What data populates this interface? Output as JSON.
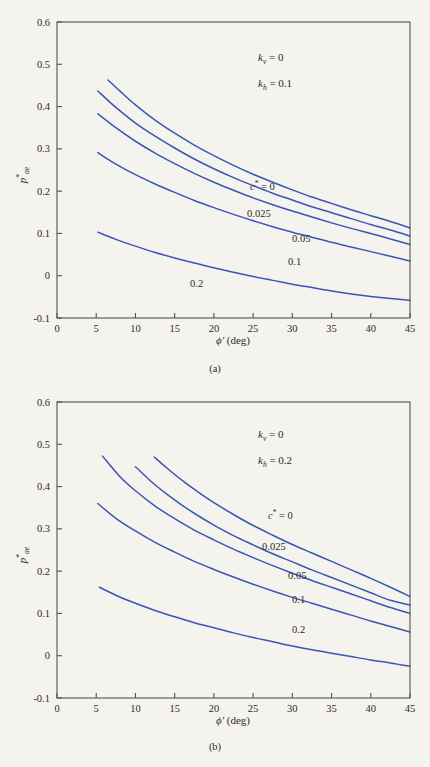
{
  "figure": {
    "background_color": "#f5f3ee",
    "curve_color": "#3a56b4",
    "axis_color": "#55524c"
  },
  "chart_data": [
    {
      "type": "line",
      "panel_id": "a",
      "subcaption": "(a)",
      "title": "",
      "xlabel": "ϕ′ (deg)",
      "ylabel": "p*ae",
      "xlim": [
        0,
        45
      ],
      "ylim": [
        -0.1,
        0.6
      ],
      "xticks": [
        0,
        5,
        10,
        15,
        20,
        25,
        30,
        35,
        40,
        45
      ],
      "xticklabels": [
        "0",
        "5",
        "10",
        "15",
        "20",
        "25",
        "30",
        "35",
        "40",
        "45"
      ],
      "yticks": [
        -0.1,
        0,
        0.1,
        0.2,
        0.3,
        0.4,
        0.5,
        0.6
      ],
      "yticklabels": [
        "-0.1",
        "0",
        "0.1",
        "0.2",
        "0.3",
        "0.4",
        "0.5",
        "0.6"
      ],
      "grid": false,
      "legend": "inline-curve-labels",
      "annotations": [
        {
          "id": "kv",
          "text": "kv = 0",
          "symbol": "k",
          "subscript": "v",
          "value": "0"
        },
        {
          "id": "kh",
          "text": "kh = 0.1",
          "symbol": "k",
          "subscript": "h",
          "value": "0.1"
        }
      ],
      "series": [
        {
          "name": "c* = 0",
          "label": "c* = 0",
          "x": [
            6.5,
            8,
            10,
            12.5,
            15,
            17.5,
            20,
            22.5,
            25,
            27.5,
            30,
            32.5,
            35,
            37.5,
            40,
            42.5,
            45
          ],
          "values": [
            0.463,
            0.437,
            0.404,
            0.368,
            0.337,
            0.309,
            0.284,
            0.261,
            0.24,
            0.221,
            0.203,
            0.186,
            0.171,
            0.156,
            0.142,
            0.128,
            0.113
          ]
        },
        {
          "name": "c* = 0.025",
          "label": "0.025",
          "x": [
            5.2,
            7.5,
            10,
            12.5,
            15,
            17.5,
            20,
            22.5,
            25,
            27.5,
            30,
            32.5,
            35,
            37.5,
            40,
            42.5,
            45
          ],
          "values": [
            0.437,
            0.398,
            0.361,
            0.33,
            0.302,
            0.276,
            0.253,
            0.232,
            0.213,
            0.195,
            0.179,
            0.163,
            0.149,
            0.135,
            0.121,
            0.108,
            0.094
          ]
        },
        {
          "name": "c* = 0.05",
          "label": "0.05",
          "x": [
            5.2,
            7.5,
            10,
            12.5,
            15,
            17.5,
            20,
            22.5,
            25,
            27.5,
            30,
            32.5,
            35,
            37.5,
            40,
            42.5,
            45
          ],
          "values": [
            0.383,
            0.35,
            0.318,
            0.29,
            0.265,
            0.242,
            0.221,
            0.202,
            0.184,
            0.168,
            0.153,
            0.139,
            0.125,
            0.112,
            0.1,
            0.087,
            0.074
          ]
        },
        {
          "name": "c* = 0.1",
          "label": "0.1",
          "x": [
            5.2,
            7.5,
            10,
            12.5,
            15,
            17.5,
            20,
            22.5,
            25,
            27.5,
            30,
            32.5,
            35,
            37.5,
            40,
            42.5,
            45
          ],
          "values": [
            0.291,
            0.264,
            0.239,
            0.217,
            0.197,
            0.178,
            0.161,
            0.145,
            0.13,
            0.116,
            0.103,
            0.091,
            0.079,
            0.068,
            0.057,
            0.046,
            0.035
          ]
        },
        {
          "name": "c* = 0.2",
          "label": "0.2",
          "x": [
            5.2,
            7.5,
            10,
            12.5,
            15,
            17.5,
            20,
            22.5,
            25,
            27.5,
            30,
            32.5,
            35,
            37.5,
            40,
            42.5,
            45
          ],
          "values": [
            0.103,
            0.086,
            0.07,
            0.055,
            0.042,
            0.03,
            0.019,
            0.008,
            -0.002,
            -0.011,
            -0.02,
            -0.028,
            -0.036,
            -0.043,
            -0.049,
            -0.054,
            -0.058
          ]
        }
      ]
    },
    {
      "type": "line",
      "panel_id": "b",
      "subcaption": "(b)",
      "title": "",
      "xlabel": "ϕ′ (deg)",
      "ylabel": "p*ae",
      "xlim": [
        0,
        45
      ],
      "ylim": [
        -0.1,
        0.6
      ],
      "xticks": [
        0,
        5,
        10,
        15,
        20,
        25,
        30,
        35,
        40,
        45
      ],
      "xticklabels": [
        "0",
        "5",
        "10",
        "15",
        "20",
        "25",
        "30",
        "35",
        "40",
        "45"
      ],
      "yticks": [
        -0.1,
        0,
        0.1,
        0.2,
        0.3,
        0.4,
        0.5,
        0.6
      ],
      "yticklabels": [
        "-0.1",
        "0",
        "0.1",
        "0.2",
        "0.3",
        "0.4",
        "0.5",
        "0.6"
      ],
      "grid": false,
      "legend": "inline-curve-labels",
      "annotations": [
        {
          "id": "kv",
          "text": "kv = 0",
          "symbol": "k",
          "subscript": "v",
          "value": "0"
        },
        {
          "id": "kh",
          "text": "kh = 0.2",
          "symbol": "k",
          "subscript": "h",
          "value": "0.2"
        }
      ],
      "series": [
        {
          "name": "c* = 0",
          "label": "c* = 0",
          "x": [
            12.4,
            14,
            16,
            18,
            20,
            22.5,
            25,
            27.5,
            30,
            32.5,
            35,
            37.5,
            40,
            42.5,
            45
          ],
          "values": [
            0.47,
            0.444,
            0.414,
            0.387,
            0.362,
            0.334,
            0.308,
            0.285,
            0.263,
            0.243,
            0.223,
            0.203,
            0.183,
            0.162,
            0.14
          ]
        },
        {
          "name": "c* = 0.025",
          "label": "0.025",
          "x": [
            10.0,
            12,
            14,
            16,
            18,
            20,
            22.5,
            25,
            27.5,
            30,
            32.5,
            35,
            37.5,
            40,
            42.5,
            45
          ],
          "values": [
            0.447,
            0.412,
            0.382,
            0.355,
            0.331,
            0.309,
            0.284,
            0.262,
            0.241,
            0.222,
            0.203,
            0.185,
            0.167,
            0.149,
            0.131,
            0.12
          ]
        },
        {
          "name": "c* = 0.05",
          "label": "0.05",
          "x": [
            5.8,
            8,
            10,
            12.5,
            15,
            17.5,
            20,
            22.5,
            25,
            27.5,
            30,
            32.5,
            35,
            37.5,
            40,
            42.5,
            45
          ],
          "values": [
            0.472,
            0.424,
            0.39,
            0.354,
            0.324,
            0.297,
            0.274,
            0.252,
            0.232,
            0.213,
            0.195,
            0.178,
            0.162,
            0.146,
            0.13,
            0.114,
            0.1
          ]
        },
        {
          "name": "c* = 0.1",
          "label": "0.1",
          "x": [
            5.2,
            7.5,
            10,
            12.5,
            15,
            17.5,
            20,
            22.5,
            25,
            27.5,
            30,
            32.5,
            35,
            37.5,
            40,
            42.5,
            45
          ],
          "values": [
            0.36,
            0.325,
            0.295,
            0.268,
            0.245,
            0.223,
            0.204,
            0.186,
            0.169,
            0.153,
            0.138,
            0.124,
            0.11,
            0.096,
            0.082,
            0.069,
            0.056
          ]
        },
        {
          "name": "c* = 0.2",
          "label": "0.2",
          "x": [
            5.4,
            7.5,
            10,
            12.5,
            15,
            17.5,
            20,
            22.5,
            25,
            27.5,
            30,
            32.5,
            35,
            37.5,
            40,
            42.5,
            45
          ],
          "values": [
            0.162,
            0.143,
            0.124,
            0.107,
            0.092,
            0.078,
            0.066,
            0.054,
            0.043,
            0.033,
            0.023,
            0.014,
            0.006,
            -0.002,
            -0.01,
            -0.017,
            -0.025
          ]
        }
      ]
    }
  ]
}
